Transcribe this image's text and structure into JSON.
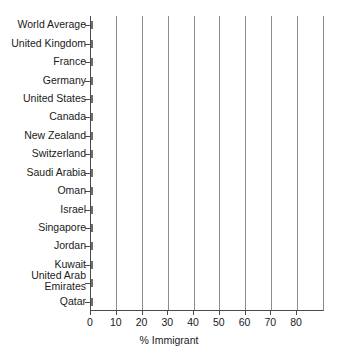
{
  "chart_data": {
    "type": "bar",
    "orientation": "horizontal",
    "title": "",
    "xlabel": "% Immigrant",
    "ylabel": "",
    "xlim": [
      0,
      90
    ],
    "xticks": [
      0,
      10,
      20,
      30,
      40,
      50,
      60,
      70,
      80
    ],
    "grid": "vertical",
    "legend": "none",
    "bar_fill_color": "#c9c9c9",
    "bar_edge_color": "#6d6d6d",
    "categories": [
      "World Average",
      "United Kingdom",
      "France",
      "Germany",
      "United States",
      "Canada",
      "New Zealand",
      "Switzerland",
      "Saudi Arabia",
      "Oman",
      "Israel",
      "Singapore",
      "Jordan",
      "Kuwait",
      "United Arab Emirates",
      "Qatar"
    ],
    "values": [
      3.5,
      10.4,
      11,
      13,
      14,
      21,
      22,
      23.5,
      27.5,
      28.5,
      40,
      40.5,
      45.5,
      69,
      70,
      86.5
    ],
    "series": [
      {
        "name": "% Immigrant",
        "values": [
          3.5,
          10.4,
          11,
          13,
          14,
          21,
          22,
          23.5,
          27.5,
          28.5,
          40,
          40.5,
          45.5,
          69,
          70,
          86.5
        ]
      }
    ]
  }
}
